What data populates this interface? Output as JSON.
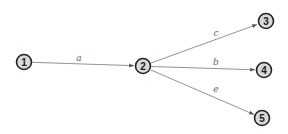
{
  "diagram": {
    "type": "directed-graph",
    "colors": {
      "node_fill": "#d9d9d9",
      "node_stroke": "#222222",
      "edge": "#777777",
      "edge_label": "#666666"
    },
    "nodes": [
      {
        "id": "1",
        "label": "1",
        "x": 24,
        "y": 62
      },
      {
        "id": "2",
        "label": "2",
        "x": 143,
        "y": 66
      },
      {
        "id": "3",
        "label": "3",
        "x": 266,
        "y": 21
      },
      {
        "id": "4",
        "label": "4",
        "x": 264,
        "y": 70
      },
      {
        "id": "5",
        "label": "5",
        "x": 262,
        "y": 118
      }
    ],
    "edges": [
      {
        "from": "1",
        "to": "2",
        "label": "a"
      },
      {
        "from": "2",
        "to": "3",
        "label": "c"
      },
      {
        "from": "2",
        "to": "4",
        "label": "b"
      },
      {
        "from": "2",
        "to": "5",
        "label": "e"
      }
    ]
  }
}
